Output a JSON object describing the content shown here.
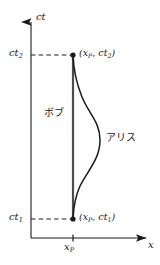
{
  "figure": {
    "kind": "minkowski-spacetime-diagram",
    "width": 160,
    "height": 265,
    "background": "#ffffff",
    "ink": "#1a1a1a"
  },
  "axes": {
    "vertical": {
      "name": "ct",
      "arrow": "up",
      "origin_px": [
        31,
        238
      ],
      "tip_px": [
        31,
        17
      ]
    },
    "horizontal": {
      "name": "x",
      "arrow": "right",
      "origin_px": [
        31,
        238
      ],
      "tip_px": [
        152,
        238
      ]
    },
    "ticks": {
      "vertical": [
        {
          "label": "ct",
          "sub": "2",
          "y_px": 55
        },
        {
          "label": "ct",
          "sub": "1",
          "y_px": 219
        }
      ],
      "horizontal": [
        {
          "label": "x",
          "sub": "P",
          "x_px": 73
        }
      ]
    }
  },
  "guides": {
    "style": "dashed",
    "lines": [
      {
        "from_px": [
          31,
          55
        ],
        "to_px": [
          73,
          55
        ]
      },
      {
        "from_px": [
          31,
          219
        ],
        "to_px": [
          73,
          219
        ]
      }
    ]
  },
  "worldlines": [
    {
      "id": "bob",
      "label": "ボブ",
      "color": "#555555",
      "shape": "straight-vertical",
      "x_px": 73,
      "from_y_px": 55,
      "to_y_px": 219
    },
    {
      "id": "alice",
      "label": "アリス",
      "color": "#1a1a1a",
      "shape": "curved-bulge-right",
      "max_x_px": 100,
      "max_x_at_y_px": 140,
      "from_px": [
        73,
        55
      ],
      "to_px": [
        73,
        219
      ]
    }
  ],
  "events": [
    {
      "id": "event-top",
      "label_x": "x",
      "label_x_sub": "P",
      "label_t": "ct",
      "label_t_sub": "2",
      "at_px": [
        73,
        55
      ]
    },
    {
      "id": "event-bottom",
      "label_x": "x",
      "label_x_sub": "P",
      "label_t": "ct",
      "label_t_sub": "1",
      "at_px": [
        73,
        219
      ]
    }
  ],
  "labels": {
    "ct_axis": "ct",
    "x_axis": "x",
    "ct2_base": "ct",
    "ct2_sub": "2",
    "ct1_base": "ct",
    "ct1_sub": "1",
    "xp_base": "x",
    "xp_sub": "P",
    "event_top_open": "(",
    "event_top_x": "x",
    "event_top_x_sub": "P",
    "event_top_comma": ", ",
    "event_top_t": "ct",
    "event_top_t_sub": "2",
    "event_top_close": ")",
    "event_bottom_open": "(",
    "event_bottom_x": "x",
    "event_bottom_x_sub": "P",
    "event_bottom_comma": ", ",
    "event_bottom_t": "ct",
    "event_bottom_t_sub": "1",
    "event_bottom_close": ")",
    "bob": "ボブ",
    "alice": "アリス"
  }
}
